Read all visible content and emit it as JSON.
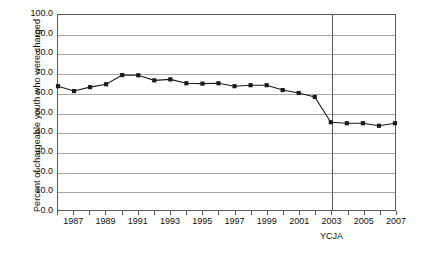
{
  "chart_data": {
    "type": "line",
    "title": "",
    "xlabel": "",
    "ylabel": "Percent of chargeable youth who were charged",
    "ylim": [
      0,
      100
    ],
    "ytick_step": 10,
    "ytick_labels": [
      "100.0",
      "90.0",
      "80.0",
      "70.0",
      "60.0",
      "50.0",
      "40.0",
      "30.0",
      "20.0",
      "10.0",
      "0.0"
    ],
    "ytick_values": [
      100,
      90,
      80,
      70,
      60,
      50,
      40,
      30,
      20,
      10,
      0
    ],
    "xlim": [
      1986,
      2007
    ],
    "grid": "horizontal",
    "legend": "none",
    "marker": "filled-square",
    "line_color": "#1a1a1a",
    "grid_color": "#a8a8a8",
    "axis_color": "#5b5b5b",
    "x": [
      1986,
      1987,
      1988,
      1989,
      1990,
      1991,
      1992,
      1993,
      1994,
      1995,
      1996,
      1997,
      1998,
      1999,
      2000,
      2001,
      2002,
      2003,
      2004,
      2005,
      2006,
      2007
    ],
    "xtick_labels_shown": [
      "1987",
      "1989",
      "1991",
      "1993",
      "1995",
      "1997",
      "1999",
      "2001",
      "2003",
      "2005",
      "2007"
    ],
    "values": [
      63.5,
      61.0,
      63.0,
      64.5,
      69.2,
      69.1,
      66.5,
      67.0,
      65.0,
      64.8,
      65.0,
      63.5,
      64.0,
      64.0,
      61.5,
      60.0,
      58.0,
      45.0,
      44.5,
      44.5,
      43.2,
      44.5
    ],
    "annotations": [
      {
        "name": "ycja",
        "label": "YCJA",
        "x": 2003,
        "type": "vertical-line"
      }
    ]
  },
  "axes": {
    "y_title": "Percent of chargeable youth who were charged"
  }
}
